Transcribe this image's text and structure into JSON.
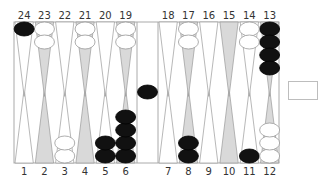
{
  "game": "Backgammon",
  "colors": {
    "board_bg": "#ffffff",
    "point_light": "#ffffff",
    "point_dark": "#d9d9d9",
    "point_stroke": "#999999",
    "checker_black": "#111111",
    "checker_white": "#ffffff",
    "checker_white_stroke": "#999999",
    "frame": "#aaaaaa"
  },
  "top_labels": [
    "24",
    "23",
    "22",
    "21",
    "20",
    "19",
    "18",
    "17",
    "16",
    "15",
    "14",
    "13"
  ],
  "bottom_labels": [
    "1",
    "2",
    "3",
    "4",
    "5",
    "6",
    "7",
    "8",
    "9",
    "10",
    "11",
    "12"
  ],
  "points": {
    "1": {
      "color": null,
      "count": 0
    },
    "2": {
      "color": null,
      "count": 0
    },
    "3": {
      "color": "white",
      "count": 2
    },
    "4": {
      "color": null,
      "count": 0
    },
    "5": {
      "color": "black",
      "count": 2
    },
    "6": {
      "color": "black",
      "count": 4
    },
    "7": {
      "color": null,
      "count": 0
    },
    "8": {
      "color": "black",
      "count": 2
    },
    "9": {
      "color": null,
      "count": 0
    },
    "10": {
      "color": null,
      "count": 0
    },
    "11": {
      "color": "black",
      "count": 1
    },
    "12": {
      "color": "white",
      "count": 3
    },
    "13": {
      "color": "black",
      "count": 4
    },
    "14": {
      "color": "white",
      "count": 2
    },
    "15": {
      "color": null,
      "count": 0
    },
    "16": {
      "color": null,
      "count": 0
    },
    "17": {
      "color": "white",
      "count": 2
    },
    "18": {
      "color": null,
      "count": 0
    },
    "19": {
      "color": "white",
      "count": 2
    },
    "20": {
      "color": null,
      "count": 0
    },
    "21": {
      "color": "white",
      "count": 2
    },
    "22": {
      "color": null,
      "count": 0
    },
    "23": {
      "color": "white",
      "count": 2
    },
    "24": {
      "color": "black",
      "count": 1
    }
  },
  "bar": {
    "black": 1,
    "white": 0
  },
  "cube_box": {
    "label": ""
  }
}
